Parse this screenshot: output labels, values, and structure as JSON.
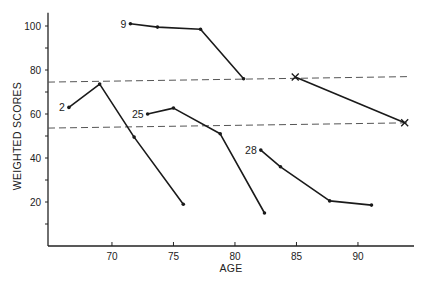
{
  "chart_data": {
    "type": "line",
    "title": "",
    "xlabel": "AGE",
    "ylabel": "WEIGHTED SCORES",
    "xlim": [
      64.8,
      94.5
    ],
    "ylim": [
      0,
      106
    ],
    "x_ticks": [
      70,
      75,
      80,
      85,
      90
    ],
    "y_ticks": [
      20,
      40,
      60,
      80,
      100
    ],
    "y_minor_ticks": [
      10,
      30,
      50,
      70,
      90
    ],
    "grid": false,
    "legend": null,
    "series": [
      {
        "name": "2",
        "label": "2",
        "marker": "dot",
        "x": [
          66.5,
          69.0,
          71.8,
          75.8
        ],
        "y": [
          63,
          73.6,
          49.5,
          19
        ]
      },
      {
        "name": "9",
        "label": "9",
        "marker": "dot",
        "x": [
          71.5,
          73.7,
          77.2,
          80.7
        ],
        "y": [
          101,
          99.5,
          98.5,
          76
        ]
      },
      {
        "name": "25",
        "label": "25",
        "marker": "dot",
        "x": [
          72.9,
          75.0,
          78.8,
          82.4
        ],
        "y": [
          60,
          62.7,
          51,
          15
        ]
      },
      {
        "name": "28",
        "label": "28",
        "marker": "dot",
        "x": [
          82.1,
          83.7,
          87.7,
          91.1
        ],
        "y": [
          43.6,
          36,
          20.5,
          18.6
        ]
      },
      {
        "name": "X",
        "label": "",
        "marker": "x",
        "x": [
          84.9,
          93.8
        ],
        "y": [
          76.8,
          56
        ]
      }
    ],
    "reference_lines": [
      {
        "name": "upper-dashed",
        "style": "dashed",
        "x": [
          64.8,
          94.2
        ],
        "y": [
          74.5,
          77
        ]
      },
      {
        "name": "lower-dashed",
        "style": "dashed",
        "x": [
          64.8,
          94.2
        ],
        "y": [
          53.6,
          56
        ]
      }
    ]
  }
}
